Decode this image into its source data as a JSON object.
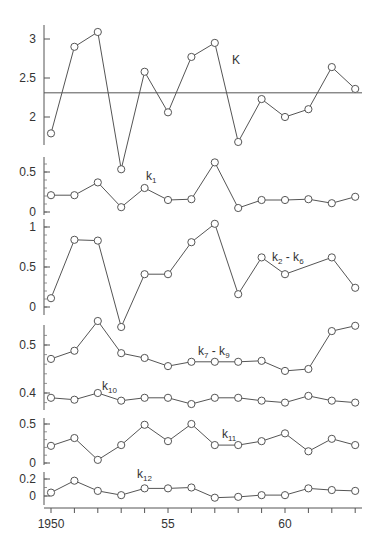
{
  "chart_data": {
    "type": "line",
    "title": "",
    "xlabel": "",
    "ylabel": "",
    "x_ticks": [
      {
        "value": 1950,
        "label": "1950"
      },
      {
        "value": 1955,
        "label": "55"
      },
      {
        "value": 1960,
        "label": "60"
      }
    ],
    "x_range": [
      1950,
      1963
    ],
    "colors": {
      "line": "#555555",
      "marker_fill": "#ffffff",
      "text": "#333333"
    },
    "panels": [
      {
        "id": "K",
        "ylim": [
          1.3,
          3.15
        ],
        "y_ticks": [
          {
            "v": 2,
            "label": "2"
          },
          {
            "v": 2.5,
            "label": "2.5"
          },
          {
            "v": 3,
            "label": "3"
          }
        ],
        "minor_step": 0,
        "reference_line": 2.31,
        "series": [
          {
            "name": "K",
            "label_main": "K",
            "label_sub": "",
            "label_pos": {
              "x": 232,
              "y": 64
            },
            "x": [
              1950,
              1951,
              1952,
              1953,
              1954,
              1955,
              1956,
              1957,
              1958,
              1959,
              1960,
              1961,
              1962,
              1963
            ],
            "values": [
              1.79,
              2.9,
              3.09,
              1.33,
              2.58,
              2.06,
              2.77,
              2.95,
              1.68,
              2.23,
              2.0,
              2.1,
              2.64,
              2.36
            ]
          }
        ]
      },
      {
        "id": "k1",
        "ylim": [
          -0.03,
          0.7
        ],
        "y_ticks": [
          {
            "v": 0,
            "label": "0"
          },
          {
            "v": 0.5,
            "label": "0.5"
          }
        ],
        "minor_step": 0.1,
        "series": [
          {
            "name": "k1",
            "label_main": "k",
            "label_sub": "1",
            "label_pos": {
              "x": 146,
              "y": 180
            },
            "x": [
              1950,
              1951,
              1952,
              1953,
              1954,
              1955,
              1956,
              1957,
              1958,
              1959,
              1960,
              1961,
              1962,
              1963
            ],
            "values": [
              0.21,
              0.21,
              0.37,
              0.06,
              0.3,
              0.15,
              0.16,
              0.62,
              0.05,
              0.15,
              0.15,
              0.16,
              0.11,
              0.19
            ]
          }
        ]
      },
      {
        "id": "k2-k6",
        "ylim": [
          -0.1,
          1.1
        ],
        "y_ticks": [
          {
            "v": 0,
            "label": "0"
          },
          {
            "v": 0.5,
            "label": "0.5"
          },
          {
            "v": 1,
            "label": "1"
          }
        ],
        "minor_step": 0.1,
        "series": [
          {
            "name": "k2 - k6",
            "label_main": "k",
            "label_sub": "2",
            "label_rest": " - k",
            "label_sub2": "6",
            "label_pos": {
              "x": 272,
              "y": 261
            },
            "x": [
              1950,
              1951,
              1952,
              1953,
              1954,
              1955,
              1956,
              1957,
              1958,
              1959,
              1960,
              1962,
              1963
            ],
            "values": [
              0.11,
              0.84,
              0.83,
              -0.25,
              0.41,
              0.41,
              0.81,
              1.04,
              0.16,
              0.62,
              0.41,
              0.62,
              0.24
            ]
          }
        ]
      },
      {
        "id": "k7-k10",
        "ylim": [
          0.37,
          0.57
        ],
        "y_ticks": [
          {
            "v": 0.4,
            "label": "0.4"
          },
          {
            "v": 0.5,
            "label": "0.5"
          }
        ],
        "minor_step": 0.02,
        "series": [
          {
            "name": "k7 - k9",
            "label_main": "k",
            "label_sub": "7",
            "label_rest": " - k",
            "label_sub2": "9",
            "label_pos": {
              "x": 198,
              "y": 355
            },
            "x": [
              1950,
              1951,
              1952,
              1953,
              1954,
              1955,
              1956,
              1957,
              1958,
              1959,
              1960,
              1961,
              1962,
              1963
            ],
            "values": [
              0.471,
              0.488,
              0.55,
              0.483,
              0.473,
              0.456,
              0.465,
              0.465,
              0.465,
              0.467,
              0.446,
              0.45,
              0.529,
              0.54
            ]
          },
          {
            "name": "k10",
            "label_main": "k",
            "label_sub": "10",
            "label_pos": {
              "x": 102,
              "y": 390
            },
            "x": [
              1950,
              1951,
              1952,
              1953,
              1954,
              1955,
              1956,
              1957,
              1958,
              1959,
              1960,
              1961,
              1962,
              1963
            ],
            "values": [
              0.39,
              0.386,
              0.4,
              0.384,
              0.39,
              0.39,
              0.377,
              0.39,
              0.39,
              0.384,
              0.38,
              0.394,
              0.384,
              0.38
            ]
          }
        ]
      },
      {
        "id": "k11",
        "ylim": [
          -0.02,
          0.6
        ],
        "y_ticks": [
          {
            "v": 0,
            "label": "0"
          },
          {
            "v": 0.5,
            "label": "0.5"
          }
        ],
        "minor_step": 0.1,
        "series": [
          {
            "name": "k11",
            "label_main": "k",
            "label_sub": "11",
            "label_pos": {
              "x": 222,
              "y": 438
            },
            "x": [
              1950,
              1951,
              1952,
              1953,
              1954,
              1955,
              1956,
              1957,
              1958,
              1959,
              1960,
              1961,
              1962,
              1963
            ],
            "values": [
              0.22,
              0.32,
              0.04,
              0.23,
              0.49,
              0.28,
              0.5,
              0.23,
              0.23,
              0.28,
              0.38,
              0.15,
              0.31,
              0.23
            ]
          }
        ]
      },
      {
        "id": "k12",
        "ylim": [
          -0.14,
          0.28
        ],
        "y_ticks": [
          {
            "v": 0,
            "label": "0"
          },
          {
            "v": 0.2,
            "label": "0.2"
          }
        ],
        "minor_step": 0.1,
        "series": [
          {
            "name": "k12",
            "label_main": "k",
            "label_sub": "12",
            "label_pos": {
              "x": 137,
              "y": 478
            },
            "x": [
              1950,
              1951,
              1952,
              1953,
              1954,
              1955,
              1956,
              1957,
              1958,
              1959,
              1960,
              1961,
              1962,
              1963
            ],
            "values": [
              0.04,
              0.18,
              0.06,
              0.01,
              0.09,
              0.09,
              0.1,
              -0.02,
              -0.01,
              0.01,
              0.01,
              0.09,
              0.07,
              0.06
            ]
          }
        ]
      }
    ]
  },
  "layout": {
    "panel_geometry": [
      {
        "id": "K",
        "spine_top": 25,
        "spine_bottom": 145,
        "v_at": [
          2,
          117
        ],
        "v_at2": [
          3,
          39
        ]
      },
      {
        "id": "k1",
        "spine_top": 157,
        "spine_bottom": 215,
        "v_at": [
          0,
          212
        ],
        "v_at2": [
          0.5,
          172
        ]
      },
      {
        "id": "k2-k6",
        "spine_top": 219,
        "spine_bottom": 315,
        "v_at": [
          0,
          307
        ],
        "v_at2": [
          1,
          227
        ]
      },
      {
        "id": "k7-k10",
        "spine_top": 325,
        "spine_bottom": 410,
        "v_at": [
          0.4,
          393
        ],
        "v_at2": [
          0.5,
          345
        ]
      },
      {
        "id": "k11",
        "spine_top": 418,
        "spine_bottom": 465,
        "v_at": [
          0,
          463
        ],
        "v_at2": [
          0.5,
          424
        ]
      },
      {
        "id": "k12",
        "spine_top": 472,
        "spine_bottom": 505,
        "v_at": [
          0,
          496
        ],
        "v_at2": [
          0.2,
          479
        ]
      }
    ],
    "x_axis_y": 508,
    "x_at": [
      1950,
      51
    ],
    "x_step_px": 23.4,
    "spine_x": 44,
    "x_axis_end": 362,
    "ref_line_x": [
      44,
      362
    ]
  }
}
